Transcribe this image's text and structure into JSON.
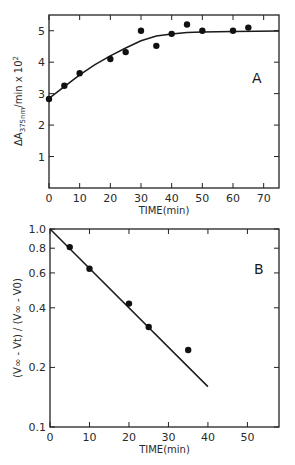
{
  "chart_data": [
    {
      "id": "A",
      "type": "scatter",
      "panel_label": "A",
      "title": "",
      "xlabel": "TIME(min)",
      "ylabel": "ΔA375nm/min × 10²",
      "ylabel_parts": {
        "main": "ΔA",
        "sub": "375nm",
        "rest": "/min x 10",
        "sup": "2"
      },
      "xlim": [
        0,
        75
      ],
      "ylim": [
        0,
        5.5
      ],
      "xticks": [
        0,
        10,
        20,
        30,
        40,
        50,
        60,
        70
      ],
      "yticks": [
        1,
        2,
        3,
        4,
        5
      ],
      "grid": false,
      "series": [
        {
          "name": "measured",
          "style": "points",
          "x": [
            0,
            5,
            10,
            20,
            25,
            30,
            35,
            40,
            45,
            50,
            60,
            65
          ],
          "y": [
            2.83,
            3.25,
            3.65,
            4.1,
            4.32,
            5.0,
            4.52,
            4.9,
            5.2,
            5.0,
            5.0,
            5.1
          ]
        },
        {
          "name": "fitted curve",
          "style": "line",
          "x": [
            0,
            5,
            10,
            15,
            20,
            25,
            30,
            35,
            40,
            45,
            50,
            60,
            75
          ],
          "y": [
            2.85,
            3.22,
            3.6,
            3.92,
            4.2,
            4.45,
            4.68,
            4.83,
            4.9,
            4.94,
            4.96,
            4.98,
            4.99
          ]
        }
      ]
    },
    {
      "id": "B",
      "type": "scatter",
      "panel_label": "B",
      "title": "",
      "xlabel": "TIME(min)",
      "ylabel": "(V∞ - Vt) / (V∞ - V0)",
      "yscale": "log",
      "xlim": [
        0,
        58
      ],
      "ylim": [
        0.1,
        1.0
      ],
      "xticks": [
        0,
        10,
        20,
        30,
        40,
        50
      ],
      "yticks": [
        0.1,
        0.2,
        0.4,
        0.6,
        0.8,
        1.0
      ],
      "ytick_labels": [
        "0.1",
        "0.2",
        "0.4",
        "0.6",
        "0.8",
        "1.0"
      ],
      "grid": false,
      "series": [
        {
          "name": "measured",
          "style": "points",
          "x": [
            5,
            10,
            20,
            25,
            35
          ],
          "y": [
            0.81,
            0.63,
            0.42,
            0.32,
            0.245
          ]
        },
        {
          "name": "linear fit",
          "style": "line",
          "x": [
            0,
            40
          ],
          "y": [
            1.0,
            0.16
          ]
        }
      ]
    }
  ]
}
